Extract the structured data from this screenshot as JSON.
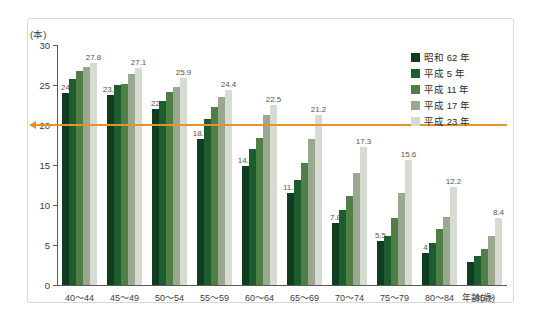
{
  "chart_data": {
    "type": "bar",
    "title": "",
    "xlabel": "年齢(歳)",
    "ylabel": "(本)",
    "ylim": [
      0,
      30
    ],
    "yticks": [
      0,
      5,
      10,
      15,
      20,
      25,
      30
    ],
    "grid": false,
    "legend_position": "top-right",
    "categories": [
      "40～44",
      "45～49",
      "50～54",
      "55～59",
      "60～64",
      "65～69",
      "70～74",
      "75～79",
      "80～84",
      "85～"
    ],
    "series": [
      {
        "name": "昭和 62 年",
        "color": "#0f3d20",
        "values": [
          24.0,
          23.8,
          22.0,
          18.3,
          14.9,
          11.5,
          7.8,
          5.5,
          4.0,
          2.9
        ]
      },
      {
        "name": "平成 5 年",
        "color": "#1d5c2e",
        "values": [
          25.8,
          25.0,
          23.0,
          20.7,
          17.0,
          13.1,
          9.4,
          6.1,
          5.2,
          3.6
        ]
      },
      {
        "name": "平成 11 年",
        "color": "#4f7f45",
        "values": [
          26.8,
          25.1,
          24.1,
          22.2,
          18.4,
          15.2,
          11.1,
          8.4,
          7.0,
          4.5
        ]
      },
      {
        "name": "平成 17 年",
        "color": "#9aa892",
        "values": [
          27.3,
          26.4,
          24.8,
          23.5,
          21.3,
          18.2,
          14.0,
          11.5,
          8.5,
          6.1
        ]
      },
      {
        "name": "平成 23 年",
        "color": "#d6dcd2",
        "values": [
          27.8,
          27.1,
          25.9,
          24.4,
          22.5,
          21.2,
          17.3,
          15.6,
          12.2,
          8.4
        ]
      }
    ],
    "point_labels": [
      {
        "category_index": 0,
        "series_index": 0,
        "text": "24"
      },
      {
        "category_index": 0,
        "series_index": 4,
        "text": "27.8"
      },
      {
        "category_index": 1,
        "series_index": 0,
        "text": "23.8"
      },
      {
        "category_index": 1,
        "series_index": 4,
        "text": "27.1"
      },
      {
        "category_index": 2,
        "series_index": 0,
        "text": "22"
      },
      {
        "category_index": 2,
        "series_index": 4,
        "text": "25.9"
      },
      {
        "category_index": 3,
        "series_index": 0,
        "text": "18.3"
      },
      {
        "category_index": 3,
        "series_index": 4,
        "text": "24.4"
      },
      {
        "category_index": 4,
        "series_index": 0,
        "text": "14.9"
      },
      {
        "category_index": 4,
        "series_index": 4,
        "text": "22.5"
      },
      {
        "category_index": 5,
        "series_index": 0,
        "text": "11.5"
      },
      {
        "category_index": 5,
        "series_index": 4,
        "text": "21.2"
      },
      {
        "category_index": 6,
        "series_index": 0,
        "text": "7.8"
      },
      {
        "category_index": 6,
        "series_index": 4,
        "text": "17.3"
      },
      {
        "category_index": 7,
        "series_index": 0,
        "text": "5.5"
      },
      {
        "category_index": 7,
        "series_index": 4,
        "text": "15.6"
      },
      {
        "category_index": 8,
        "series_index": 0,
        "text": "4"
      },
      {
        "category_index": 8,
        "series_index": 4,
        "text": "12.2"
      },
      {
        "category_index": 9,
        "series_index": 4,
        "text": "8.4"
      }
    ],
    "reference_line": {
      "value": 20,
      "color": "#e8922e",
      "arrow": "left"
    }
  }
}
